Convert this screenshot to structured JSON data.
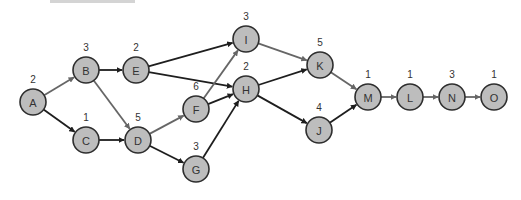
{
  "diagram": {
    "type": "network-activity-diagram",
    "colors": {
      "node_fill": "#bdbdbd",
      "node_stroke": "#2e2e2e",
      "edge_dark": "#1e1e1e",
      "edge_gray": "#666666",
      "background": "#ffffff"
    },
    "nodes": [
      {
        "id": "A",
        "duration": "2",
        "x": 33,
        "y": 102
      },
      {
        "id": "B",
        "duration": "3",
        "x": 86,
        "y": 70
      },
      {
        "id": "C",
        "duration": "1",
        "x": 86,
        "y": 140
      },
      {
        "id": "D",
        "duration": "5",
        "x": 138,
        "y": 140
      },
      {
        "id": "E",
        "duration": "2",
        "x": 136,
        "y": 70
      },
      {
        "id": "F",
        "duration": "6",
        "x": 196,
        "y": 109
      },
      {
        "id": "G",
        "duration": "3",
        "x": 196,
        "y": 169
      },
      {
        "id": "H",
        "duration": "2",
        "x": 246,
        "y": 89
      },
      {
        "id": "I",
        "duration": "3",
        "x": 246,
        "y": 39
      },
      {
        "id": "J",
        "duration": "4",
        "x": 319,
        "y": 130
      },
      {
        "id": "K",
        "duration": "5",
        "x": 320,
        "y": 65
      },
      {
        "id": "M",
        "duration": "1",
        "x": 368,
        "y": 97
      },
      {
        "id": "L",
        "duration": "1",
        "x": 410,
        "y": 97
      },
      {
        "id": "N",
        "duration": "3",
        "x": 452,
        "y": 97
      },
      {
        "id": "O",
        "duration": "1",
        "x": 494,
        "y": 97
      }
    ],
    "edges": [
      {
        "from": "A",
        "to": "B",
        "style": "gray"
      },
      {
        "from": "A",
        "to": "C",
        "style": "dark"
      },
      {
        "from": "B",
        "to": "E",
        "style": "dark"
      },
      {
        "from": "B",
        "to": "D",
        "style": "gray"
      },
      {
        "from": "C",
        "to": "D",
        "style": "dark"
      },
      {
        "from": "E",
        "to": "I",
        "style": "dark"
      },
      {
        "from": "E",
        "to": "H",
        "style": "dark"
      },
      {
        "from": "D",
        "to": "F",
        "style": "gray"
      },
      {
        "from": "D",
        "to": "G",
        "style": "dark"
      },
      {
        "from": "F",
        "to": "I",
        "style": "gray"
      },
      {
        "from": "F",
        "to": "H",
        "style": "dark"
      },
      {
        "from": "G",
        "to": "H",
        "style": "dark"
      },
      {
        "from": "I",
        "to": "K",
        "style": "gray"
      },
      {
        "from": "H",
        "to": "K",
        "style": "dark"
      },
      {
        "from": "H",
        "to": "J",
        "style": "dark"
      },
      {
        "from": "K",
        "to": "M",
        "style": "gray"
      },
      {
        "from": "J",
        "to": "M",
        "style": "dark"
      },
      {
        "from": "M",
        "to": "L",
        "style": "gray"
      },
      {
        "from": "L",
        "to": "N",
        "style": "gray"
      },
      {
        "from": "N",
        "to": "O",
        "style": "gray"
      }
    ]
  }
}
